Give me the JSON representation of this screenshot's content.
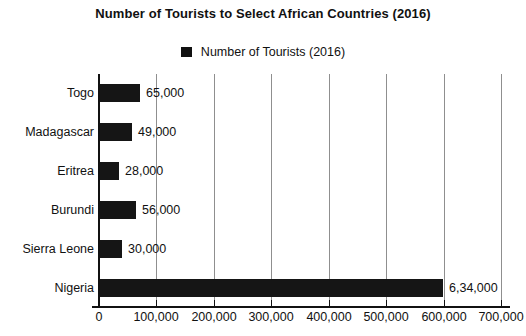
{
  "chart": {
    "title": "Number of Tourists to Select African Countries (2016)",
    "legend": {
      "position": "top-center",
      "swatch_name": "legend-color-swatch",
      "label": "Number of Tourists (2016)"
    }
  },
  "chart_data": {
    "type": "bar",
    "orientation": "horizontal",
    "title": "Number of Tourists to Select African Countries (2016)",
    "xlabel": "",
    "ylabel": "",
    "grid": true,
    "legend_position": "top-center",
    "series": [
      {
        "name": "Number of Tourists (2016)",
        "color": "#151515",
        "values": [
          65000,
          49000,
          28000,
          56000,
          30000,
          634000
        ]
      }
    ],
    "categories": [
      "Togo",
      "Madagascar",
      "Eritrea",
      "Burundi",
      "Sierra Leone",
      "Nigeria"
    ],
    "data_labels": [
      "65,000",
      "49,000",
      "28,000",
      "56,000",
      "30,000",
      "6,34,000"
    ],
    "xlim": [
      0,
      700000
    ],
    "xticks": [
      0,
      100000,
      200000,
      300000,
      400000,
      500000,
      600000,
      700000
    ],
    "xtick_labels": [
      "0",
      "100,000",
      "200,000",
      "300,000",
      "400,000",
      "500,000",
      "600,000",
      "700,000"
    ],
    "bars": [
      {
        "category": "Togo",
        "value": 65000,
        "label": "65,000",
        "pixel_width": 41,
        "pixel_top": 10
      },
      {
        "category": "Madagascar",
        "value": 49000,
        "label": "49,000",
        "pixel_width": 33,
        "pixel_top": 49
      },
      {
        "category": "Eritrea",
        "value": 28000,
        "label": "28,000",
        "pixel_width": 20,
        "pixel_top": 88
      },
      {
        "category": "Burundi",
        "value": 56000,
        "label": "56,000",
        "pixel_width": 37,
        "pixel_top": 127
      },
      {
        "category": "Sierra Leone",
        "value": 30000,
        "label": "30,000",
        "pixel_width": 23,
        "pixel_top": 166
      },
      {
        "category": "Nigeria",
        "value": 634000,
        "label": "6,34,000",
        "pixel_width": 344,
        "pixel_top": 205
      }
    ]
  }
}
